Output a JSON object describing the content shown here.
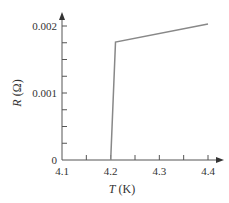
{
  "chart_data": {
    "type": "line",
    "title": "",
    "xlabel": "T (K)",
    "xlabel_var": "T",
    "xlabel_unit": " (K)",
    "ylabel": "R (Ω)",
    "ylabel_var": "R",
    "ylabel_unit": " (Ω)",
    "xlim": [
      4.1,
      4.4
    ],
    "ylim": [
      0,
      0.002
    ],
    "x_ticks": [
      "4.1",
      "4.2",
      "4.3",
      "4.4"
    ],
    "y_ticks": [
      "0",
      "0.001",
      "0.002"
    ],
    "x_minor_tick_step": 0.05,
    "y_minor_tick_step": 0.00025,
    "grid": false,
    "legend": null,
    "series": [
      {
        "name": "R vs T",
        "x": [
          4.2,
          4.21,
          4.4
        ],
        "y": [
          0,
          0.00176,
          0.00203
        ]
      }
    ],
    "line_color": "#888888",
    "axis_color": "#555555"
  }
}
